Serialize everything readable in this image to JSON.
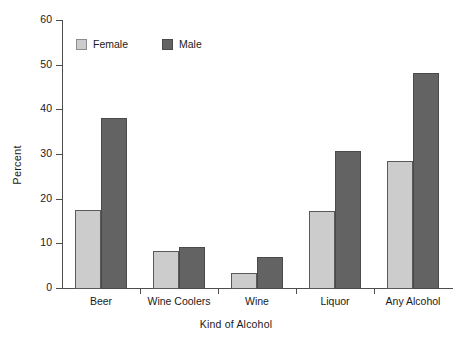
{
  "chart_data": {
    "type": "bar",
    "title": "",
    "xlabel": "Kind of Alcohol",
    "ylabel": "Percent",
    "categories": [
      "Beer",
      "Wine Coolers",
      "Wine",
      "Liquor",
      "Any Alcohol"
    ],
    "series": [
      {
        "name": "Female",
        "color": "#cccccc",
        "values": [
          17.5,
          8.3,
          3.3,
          17.2,
          28.5
        ]
      },
      {
        "name": "Male",
        "color": "#636363",
        "values": [
          38.0,
          9.2,
          7.0,
          30.7,
          48.2
        ]
      }
    ],
    "ylim": [
      0,
      60
    ],
    "yticks": [
      0,
      10,
      20,
      30,
      40,
      50,
      60
    ],
    "ytick_labels": [
      "0",
      "10",
      "20",
      "30",
      "40",
      "50",
      "60"
    ],
    "grid": false,
    "legend_position": "top-left-inside"
  },
  "legend": {
    "items": [
      {
        "label": "Female",
        "swatch": "female-swatch"
      },
      {
        "label": "Male",
        "swatch": "male-swatch"
      }
    ]
  },
  "axes": {
    "y_label": "Percent",
    "x_label": "Kind of Alcohol"
  }
}
